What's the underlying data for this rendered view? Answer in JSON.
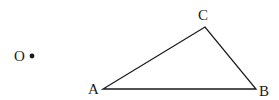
{
  "diagram": {
    "type": "geometry-triangle",
    "stroke_color": "#1a1a1a",
    "background": "#ffffff",
    "points": {
      "O": {
        "label": "O",
        "x": 32,
        "y": 56,
        "label_x": 14,
        "label_y": 61
      },
      "A": {
        "label": "A",
        "x": 103,
        "y": 89,
        "label_x": 88,
        "label_y": 94
      },
      "B": {
        "label": "B",
        "x": 256,
        "y": 89,
        "label_x": 259,
        "label_y": 96
      },
      "C": {
        "label": "C",
        "x": 205,
        "y": 27,
        "label_x": 198,
        "label_y": 20
      }
    },
    "segments": [
      {
        "from": "A",
        "to": "B"
      },
      {
        "from": "B",
        "to": "C"
      },
      {
        "from": "C",
        "to": "A"
      }
    ]
  }
}
